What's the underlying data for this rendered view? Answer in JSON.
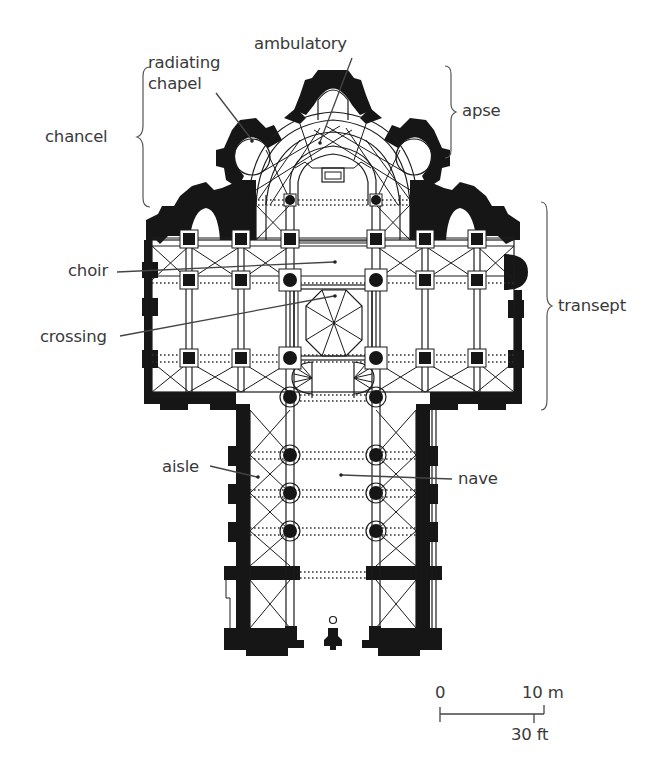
{
  "diagram": {
    "type": "architectural floor plan",
    "labels": {
      "radiating_chapel_line1": "radiating",
      "radiating_chapel_line2": "chapel",
      "ambulatory": "ambulatory",
      "chancel": "chancel",
      "apse": "apse",
      "choir": "choir",
      "crossing": "crossing",
      "transept": "transept",
      "aisle": "aisle",
      "nave": "nave"
    },
    "scale_bar": {
      "start_label": "0",
      "metric_label": "10 m",
      "imperial_label": "30 ft"
    },
    "colors": {
      "wall": "#161616",
      "line": "#1c1c1c",
      "label_text": "#3a3a3a",
      "background": "#ffffff"
    }
  }
}
